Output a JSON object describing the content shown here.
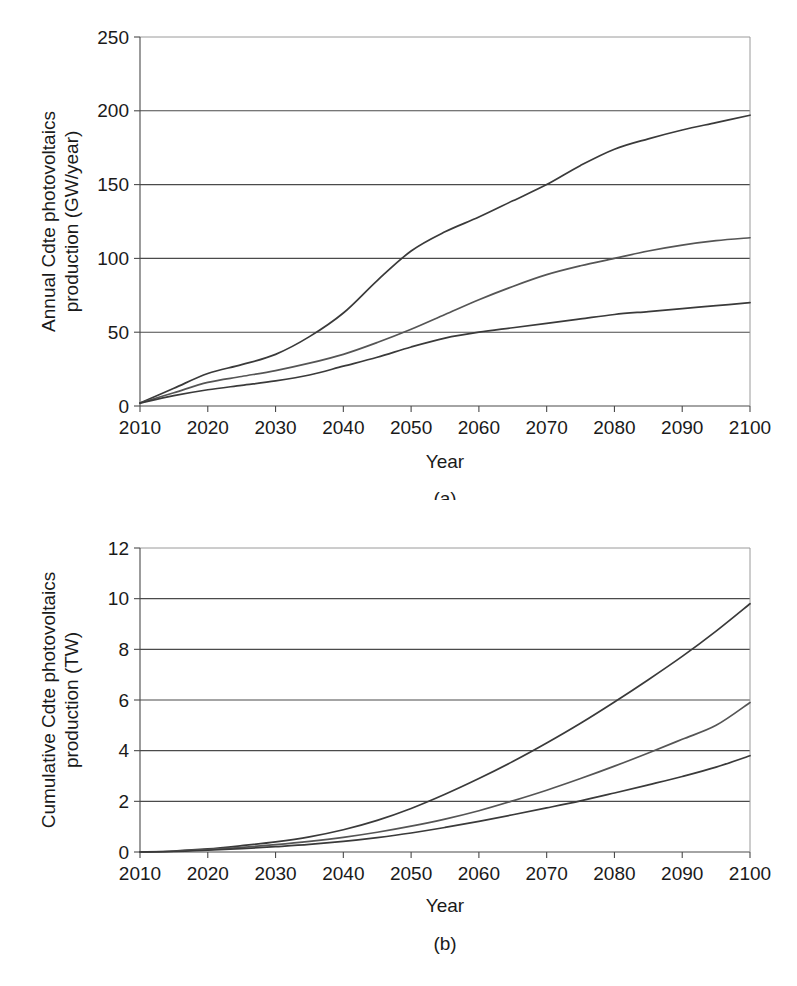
{
  "figure": {
    "panels": [
      {
        "caption": "(a)",
        "xlabel": "Year",
        "ylabel_line1": "Annual Cdte photovoltaics",
        "ylabel_line2": "production (GW/year)"
      },
      {
        "caption": "(b)",
        "xlabel": "Year",
        "ylabel_line1": "Cumulative Cdte photovoltaics",
        "ylabel_line2": "production (TW)"
      }
    ]
  },
  "chart_data": [
    {
      "type": "line",
      "title": "",
      "xlabel": "Year",
      "ylabel": "Annual Cdte photovoltaics production (GW/year)",
      "panel": "(a)",
      "grid": true,
      "legend": "none",
      "xlim": [
        2010,
        2100
      ],
      "ylim": [
        0,
        250
      ],
      "xticks": [
        2010,
        2020,
        2030,
        2040,
        2050,
        2060,
        2070,
        2080,
        2090,
        2100
      ],
      "yticks": [
        0,
        50,
        100,
        150,
        200,
        250
      ],
      "x": [
        2010,
        2015,
        2020,
        2025,
        2030,
        2035,
        2040,
        2045,
        2050,
        2055,
        2060,
        2065,
        2070,
        2075,
        2080,
        2085,
        2090,
        2095,
        2100
      ],
      "series": [
        {
          "name": "high",
          "color": "#3a3a3a",
          "values": [
            2,
            12,
            22,
            28,
            35,
            47,
            63,
            85,
            105,
            118,
            128,
            139,
            150,
            163,
            174,
            181,
            187,
            192,
            197
          ]
        },
        {
          "name": "medium",
          "color": "#555555",
          "values": [
            2,
            9,
            16,
            20,
            24,
            29,
            35,
            43,
            52,
            62,
            72,
            81,
            89,
            95,
            100,
            105,
            109,
            112,
            114
          ]
        },
        {
          "name": "low",
          "color": "#3a3a3a",
          "values": [
            2,
            7,
            11,
            14,
            17,
            21,
            27,
            33,
            40,
            46,
            50,
            53,
            56,
            59,
            62,
            64,
            66,
            68,
            70
          ]
        }
      ]
    },
    {
      "type": "line",
      "title": "",
      "xlabel": "Year",
      "ylabel": "Cumulative Cdte photovoltaics production (TW)",
      "panel": "(b)",
      "grid": true,
      "legend": "none",
      "xlim": [
        2010,
        2100
      ],
      "ylim": [
        0,
        12
      ],
      "xticks": [
        2010,
        2020,
        2030,
        2040,
        2050,
        2060,
        2070,
        2080,
        2090,
        2100
      ],
      "yticks": [
        0,
        2,
        4,
        6,
        8,
        10,
        12
      ],
      "x": [
        2010,
        2015,
        2020,
        2025,
        2030,
        2035,
        2040,
        2045,
        2050,
        2055,
        2060,
        2065,
        2070,
        2075,
        2080,
        2085,
        2090,
        2095,
        2100
      ],
      "series": [
        {
          "name": "high",
          "color": "#3a3a3a",
          "values": [
            0,
            0.04,
            0.12,
            0.25,
            0.4,
            0.6,
            0.88,
            1.25,
            1.72,
            2.28,
            2.9,
            3.57,
            4.3,
            5.08,
            5.92,
            6.8,
            7.72,
            8.72,
            9.8
          ]
        },
        {
          "name": "medium",
          "color": "#555555",
          "values": [
            0,
            0.03,
            0.09,
            0.18,
            0.29,
            0.42,
            0.58,
            0.78,
            1.02,
            1.3,
            1.63,
            2.02,
            2.44,
            2.9,
            3.39,
            3.91,
            4.45,
            5.0,
            5.9
          ]
        },
        {
          "name": "low",
          "color": "#3a3a3a",
          "values": [
            0,
            0.02,
            0.07,
            0.13,
            0.21,
            0.3,
            0.42,
            0.57,
            0.75,
            0.97,
            1.21,
            1.47,
            1.74,
            2.02,
            2.33,
            2.65,
            2.98,
            3.35,
            3.8
          ]
        }
      ]
    }
  ]
}
